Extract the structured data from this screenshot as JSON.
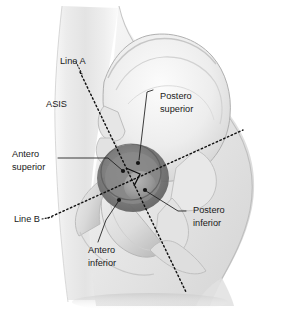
{
  "figure": {
    "background_color": "#ffffff",
    "line_color": "#111111",
    "text_color": "#1a1a1a",
    "bone_light": "#f2f2f2",
    "bone_mid": "#d8d8d8",
    "bone_shadow": "#a8a8a8",
    "acetabulum_dark": "#6f6f6f",
    "body_tint": "#e9e9e9"
  },
  "labels": {
    "line_a": "Line A",
    "asis": "ASIS",
    "postero_superior_line1": "Postero",
    "postero_superior_line2": "superior",
    "antero_superior_line1": "Antero",
    "antero_superior_line2": "superior",
    "postero_inferior_line1": "Postero",
    "postero_inferior_line2": "inferior",
    "antero_inferior_line1": "Antero",
    "antero_inferior_line2": "inferior",
    "line_b": "Line B"
  },
  "reference_lines": [
    {
      "name": "Line A",
      "style": "dotted",
      "x1": 80,
      "y1": 72,
      "x2": 186,
      "y2": 292
    },
    {
      "name": "Line B",
      "style": "dotted",
      "x1": 48,
      "y1": 218,
      "x2": 243,
      "y2": 130
    }
  ],
  "intersection": {
    "x": 131,
    "y": 178,
    "marker": "right-angle-bracket"
  }
}
